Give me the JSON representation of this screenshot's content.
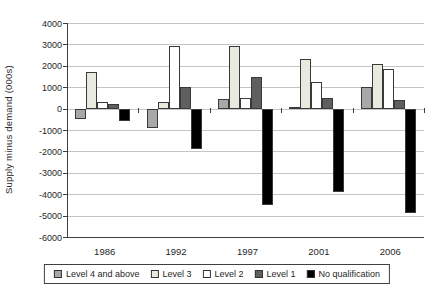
{
  "chart_data": {
    "type": "bar",
    "title": "",
    "xlabel": "",
    "ylabel": "Supply minus demand (000s)",
    "categories": [
      "1986",
      "1992",
      "1997",
      "2001",
      "2006"
    ],
    "series": [
      {
        "name": "Level 4 and above",
        "color": "#a8a8a8",
        "values": [
          -500,
          -900,
          450,
          100,
          1000
        ]
      },
      {
        "name": "Level 3",
        "color": "#e9e9e0",
        "values": [
          1700,
          300,
          2950,
          2300,
          2100
        ]
      },
      {
        "name": "Level 2",
        "color": "#ffffff",
        "values": [
          300,
          2950,
          500,
          1250,
          1850
        ]
      },
      {
        "name": "Level 1",
        "color": "#5f5f5f",
        "values": [
          200,
          1000,
          1500,
          500,
          400
        ]
      },
      {
        "name": "No qualification",
        "color": "#000000",
        "values": [
          -600,
          -1900,
          -4500,
          -3900,
          -4900
        ]
      }
    ],
    "ylim": [
      -6000,
      4000
    ],
    "ytick_step": 1000,
    "grid": true,
    "legend_position": "bottom"
  },
  "colors": {
    "gridline": "#c4c4c4",
    "axis": "#404040",
    "bar_border": "#3a3a3a",
    "text": "#1f1f1f",
    "background": "#ffffff"
  }
}
